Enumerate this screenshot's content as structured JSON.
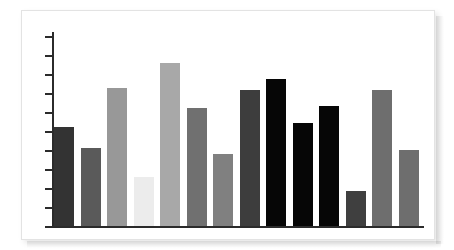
{
  "card": {
    "background_color": "#ffffff",
    "border_color": "#e3e3e3"
  },
  "chart_data": {
    "type": "bar",
    "title": "",
    "subtitle": "",
    "xlabel": "",
    "ylabel": "",
    "categories": [
      "1",
      "2",
      "3",
      "4",
      "5",
      "6",
      "7",
      "8",
      "9",
      "10",
      "11",
      "12",
      "13",
      "14"
    ],
    "values": [
      51,
      40,
      71,
      25,
      84,
      61,
      37,
      70,
      76,
      53,
      62,
      18,
      70,
      39
    ],
    "ylim": [
      0,
      100
    ],
    "y_tick_count": 10,
    "y_tick_values": [
      0,
      10,
      20,
      30,
      40,
      50,
      60,
      70,
      80,
      90,
      100
    ],
    "y_tick_labels": [],
    "x_tick_labels": [],
    "grid": false,
    "legend": false,
    "legend_position": "none",
    "axis_color": "#2b2b2b",
    "bar_colors": [
      "#333333",
      "#5a5a5a",
      "#989898",
      "#ececec",
      "#a8a8a8",
      "#707070",
      "#808080",
      "#3d3d3d",
      "#060606",
      "#060606",
      "#060606",
      "#3f3f3f",
      "#6e6e6e",
      "#6e6e6e"
    ],
    "bar_width_px": 20,
    "bar_pitch_px": 26.5,
    "annotations": []
  }
}
